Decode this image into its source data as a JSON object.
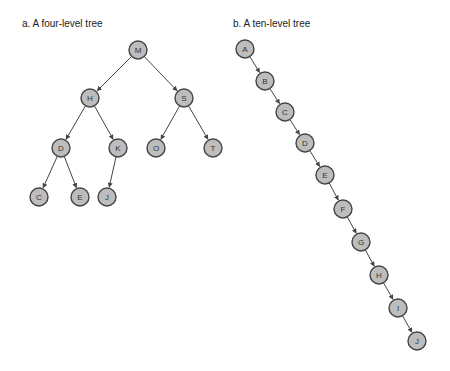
{
  "captions": {
    "left": "a. A four-level tree",
    "right": "b. A ten-level tree"
  },
  "colors": {
    "node_fill": "#bdbdbd",
    "node_stroke": "#444444",
    "edge": "#444444"
  },
  "trees": [
    {
      "id": "four-level",
      "nodes": [
        {
          "label": "M",
          "x": 138,
          "y": 50
        },
        {
          "label": "H",
          "x": 90,
          "y": 98
        },
        {
          "label": "S",
          "x": 184,
          "y": 98
        },
        {
          "label": "D",
          "x": 61,
          "y": 148
        },
        {
          "label": "K",
          "x": 118,
          "y": 148
        },
        {
          "label": "O",
          "x": 156,
          "y": 148
        },
        {
          "label": "T",
          "x": 213,
          "y": 148
        },
        {
          "label": "C",
          "x": 39,
          "y": 197
        },
        {
          "label": "E",
          "x": 80,
          "y": 197
        },
        {
          "label": "J",
          "x": 107,
          "y": 197
        }
      ],
      "edges": [
        [
          "M",
          "H"
        ],
        [
          "M",
          "S"
        ],
        [
          "H",
          "D"
        ],
        [
          "H",
          "K"
        ],
        [
          "S",
          "O"
        ],
        [
          "S",
          "T"
        ],
        [
          "D",
          "C"
        ],
        [
          "D",
          "E"
        ],
        [
          "K",
          "J"
        ]
      ]
    },
    {
      "id": "ten-level",
      "nodes": [
        {
          "label": "A",
          "x": 245,
          "y": 49
        },
        {
          "label": "B",
          "x": 265,
          "y": 81
        },
        {
          "label": "C",
          "x": 285,
          "y": 112
        },
        {
          "label": "D",
          "x": 305,
          "y": 143
        },
        {
          "label": "E",
          "x": 325,
          "y": 175
        },
        {
          "label": "F",
          "x": 343,
          "y": 209
        },
        {
          "label": "G",
          "x": 361,
          "y": 242
        },
        {
          "label": "H",
          "x": 379,
          "y": 275
        },
        {
          "label": "I",
          "x": 398,
          "y": 308
        },
        {
          "label": "J",
          "x": 417,
          "y": 341
        }
      ],
      "edges": [
        [
          "A",
          "B"
        ],
        [
          "B",
          "C"
        ],
        [
          "C",
          "D"
        ],
        [
          "D",
          "E"
        ],
        [
          "E",
          "F"
        ],
        [
          "F",
          "G"
        ],
        [
          "G",
          "H"
        ],
        [
          "H",
          "I"
        ],
        [
          "I",
          "J"
        ]
      ]
    }
  ]
}
